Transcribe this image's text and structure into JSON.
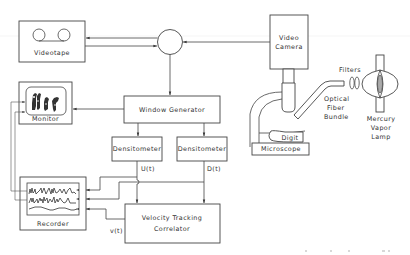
{
  "diagram": {
    "title": "",
    "blocks": {
      "videotape": "Videotape",
      "monitor": "Monitor",
      "window_generator": "Window Generator",
      "densitometer_upstream": "Densitometer",
      "densitometer_downstream": "Densitometer",
      "velocity_correlator_line1": "Velocity  Tracking",
      "velocity_correlator_line2": "Correlator",
      "recorder": "Recorder",
      "video_camera_line1": "Video",
      "video_camera_line2": "Camera",
      "microscope": "Microscope",
      "digit": "Digit",
      "optical_fiber_line1": "Optical",
      "optical_fiber_line2": "Fiber",
      "optical_fiber_line3": "Bundle",
      "filters": "Filters",
      "lamp_line1": "Mercury",
      "lamp_line2": "Vapor",
      "lamp_line3": "Lamp"
    },
    "signals": {
      "upstream": "U(t)",
      "downstream": "D(t)",
      "velocity": "v(t)"
    },
    "connections": [
      {
        "from": "video-camera",
        "to": "video-switch"
      },
      {
        "from": "video-switch",
        "to": "videotape"
      },
      {
        "from": "videotape",
        "to": "video-switch"
      },
      {
        "from": "video-switch",
        "to": "window-generator"
      },
      {
        "from": "window-generator",
        "to": "monitor"
      },
      {
        "from": "window-generator",
        "to": "densitometer-upstream"
      },
      {
        "from": "window-generator",
        "to": "densitometer-downstream"
      },
      {
        "from": "densitometer-upstream",
        "to": "velocity-correlator",
        "label": "U(t)"
      },
      {
        "from": "densitometer-downstream",
        "to": "velocity-correlator",
        "label": "D(t)"
      },
      {
        "from": "densitometer-upstream",
        "to": "recorder",
        "label": "U(t)"
      },
      {
        "from": "densitometer-downstream",
        "to": "recorder",
        "label": "D(t)"
      },
      {
        "from": "velocity-correlator",
        "to": "recorder",
        "label": "v(t)"
      },
      {
        "from": "recorder",
        "to": "monitor"
      }
    ]
  }
}
